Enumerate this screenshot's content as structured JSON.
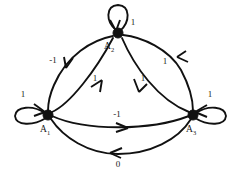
{
  "diagram": {
    "type": "directed-graph",
    "title": "",
    "background_color": "#ffffff",
    "stroke_color": "#111111",
    "nodes": [
      {
        "id": "A1",
        "label_base": "A",
        "label_sub": "1",
        "label_full": "A₁",
        "x": 48,
        "y": 115,
        "radius": 5,
        "self_loop_label": "1",
        "self_loop_label_x": 23,
        "self_loop_label_y": 97
      },
      {
        "id": "A2",
        "label_base": "A",
        "label_sub": "2",
        "label_full": "A₂",
        "x": 118,
        "y": 33,
        "radius": 5,
        "self_loop_label": "1",
        "self_loop_label_x": 133,
        "self_loop_label_y": 25
      },
      {
        "id": "A3",
        "label_base": "A",
        "label_sub": "3",
        "label_full": "A₃",
        "x": 193,
        "y": 115,
        "radius": 5,
        "self_loop_label": "1",
        "self_loop_label_x": 210,
        "self_loop_label_y": 97
      }
    ],
    "edges": [
      {
        "id": "e-a2-a1-outer",
        "from": "A2",
        "to": "A1",
        "label": "-1",
        "label_x": 53,
        "label_y": 63,
        "style": "outer-arc-left"
      },
      {
        "id": "e-a1-a2-inner",
        "from": "A1",
        "to": "A2",
        "label": "1",
        "label_x": 95,
        "label_y": 81,
        "style": "inner-left"
      },
      {
        "id": "e-a2-a3-inner",
        "from": "A2",
        "to": "A3",
        "label": "1",
        "label_x": 143,
        "label_y": 81,
        "style": "inner-right"
      },
      {
        "id": "e-a3-a2-outer",
        "from": "A3",
        "to": "A2",
        "label": "1",
        "label_x": 165,
        "label_y": 64,
        "style": "outer-arc-right"
      },
      {
        "id": "e-a1-a3-middle",
        "from": "A1",
        "to": "A3",
        "label": "-1",
        "label_x": 117,
        "label_y": 117,
        "style": "middle-horizontal"
      },
      {
        "id": "e-a3-a1-bottom",
        "from": "A3",
        "to": "A1",
        "label": "0",
        "label_x": 118,
        "label_y": 167,
        "style": "bottom-arc"
      }
    ]
  }
}
